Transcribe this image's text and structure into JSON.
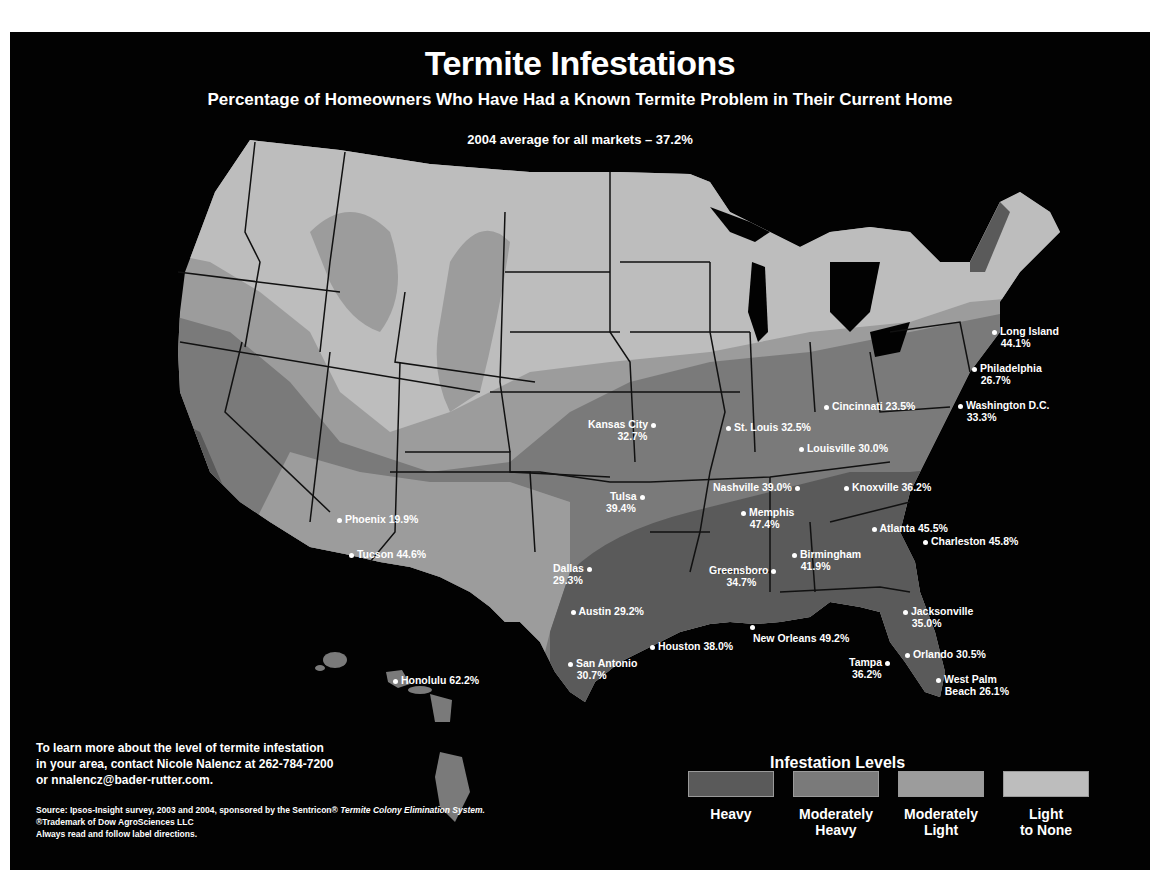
{
  "title": "Termite Infestations",
  "subtitle": "Percentage of Homeowners Who Have Had a Known Termite Problem in Their Current Home",
  "average": "2004 average for all markets – 37.2%",
  "colors": {
    "background": "#020202",
    "heavy": "#5a5a5a",
    "moderately_heavy": "#7a7a7a",
    "moderately_light": "#9c9c9c",
    "light_to_none": "#bdbdbd",
    "state_border": "#111111",
    "text": "#ffffff"
  },
  "cities": [
    {
      "name": "Long Island",
      "value": "44.1%",
      "label_line1": "Long Island",
      "label_line2": "44.1%"
    },
    {
      "name": "Philadelphia",
      "value": "26.7%",
      "label_line1": "Philadelphia",
      "label_line2": "26.7%"
    },
    {
      "name": "Washington D.C.",
      "value": "33.3%",
      "label_line1": "Washington D.C.",
      "label_line2": "33.3%"
    },
    {
      "name": "Cincinnati",
      "value": "23.5%",
      "label_line1": "Cincinnati 23.5%"
    },
    {
      "name": "Kansas City",
      "value": "32.7%",
      "label_line1": "Kansas City",
      "label_line2": "32.7%"
    },
    {
      "name": "St. Louis",
      "value": "32.5%",
      "label_line1": "St. Louis 32.5%"
    },
    {
      "name": "Louisville",
      "value": "30.0%",
      "label_line1": "Louisville 30.0%"
    },
    {
      "name": "Nashville",
      "value": "39.0%",
      "label_line1": "Nashville 39.0%"
    },
    {
      "name": "Knoxville",
      "value": "36.2%",
      "label_line1": "Knoxville 36.2%"
    },
    {
      "name": "Tulsa",
      "value": "39.4%",
      "label_line1": "Tulsa",
      "label_line2": "39.4%"
    },
    {
      "name": "Memphis",
      "value": "47.4%",
      "label_line1": "Memphis",
      "label_line2": "47.4%"
    },
    {
      "name": "Atlanta",
      "value": "45.5%",
      "label_line1": "Atlanta 45.5%"
    },
    {
      "name": "Phoenix",
      "value": "19.9%",
      "label_line1": "Phoenix 19.9%"
    },
    {
      "name": "Charleston",
      "value": "45.8%",
      "label_line1": "Charleston 45.8%"
    },
    {
      "name": "Tucson",
      "value": "44.6%",
      "label_line1": "Tucson 44.6%"
    },
    {
      "name": "Birmingham",
      "value": "41.9%",
      "label_line1": "Birmingham",
      "label_line2": "41.9%"
    },
    {
      "name": "Dallas",
      "value": "29.3%",
      "label_line1": "Dallas",
      "label_line2": "29.3%"
    },
    {
      "name": "Greensboro",
      "value": "34.7%",
      "label_line1": "Greensboro",
      "label_line2": "34.7%"
    },
    {
      "name": "Austin",
      "value": "29.2%",
      "label_line1": "Austin 29.2%"
    },
    {
      "name": "Jacksonville",
      "value": "35.0%",
      "label_line1": "Jacksonville",
      "label_line2": "35.0%"
    },
    {
      "name": "New Orleans",
      "value": "49.2%",
      "label_line1": "New Orleans 49.2%"
    },
    {
      "name": "Houston",
      "value": "38.0%",
      "label_line1": "Houston 38.0%"
    },
    {
      "name": "Orlando",
      "value": "30.5%",
      "label_line1": "Orlando 30.5%"
    },
    {
      "name": "San Antonio",
      "value": "30.7%",
      "label_line1": "San Antonio",
      "label_line2": "30.7%"
    },
    {
      "name": "Tampa",
      "value": "36.2%",
      "label_line1": "Tampa",
      "label_line2": "36.2%"
    },
    {
      "name": "Honolulu",
      "value": "62.2%",
      "label_line1": "Honolulu 62.2%"
    },
    {
      "name": "West Palm Beach",
      "value": "26.1%",
      "label_line1": "West Palm",
      "label_line2": "Beach 26.1%"
    }
  ],
  "contact": {
    "line1": "To learn more about the level of termite infestation",
    "line2": "in your area, contact Nicole Nalencz at 262-784-7200",
    "line3": "or nnalencz@bader-rutter.com."
  },
  "source": {
    "prefix": "Source: Ipsos-Insight survey, 2003 and 2004, sponsored by the Sentricon®",
    "italic": "Termite Colony Elimination System.",
    "trademark": "®Trademark of Dow AgroSciences LLC",
    "directions": "Always read and follow label directions."
  },
  "legend": {
    "title": "Infestation Levels",
    "items": [
      {
        "label1": "Heavy",
        "label2": "",
        "color": "#5a5a5a"
      },
      {
        "label1": "Moderately",
        "label2": "Heavy",
        "color": "#7a7a7a"
      },
      {
        "label1": "Moderately",
        "label2": "Light",
        "color": "#9c9c9c"
      },
      {
        "label1": "Light",
        "label2": "to None",
        "color": "#bdbdbd"
      }
    ]
  }
}
